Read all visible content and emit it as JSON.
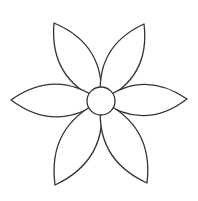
{
  "drawing": {
    "subject": "six-petal flower outline",
    "stroke_color": "#333333",
    "fill_color": "#ffffff",
    "background": "#ffffff",
    "stroke_width": 1.3,
    "center": {
      "cx": 101,
      "cy": 101,
      "r": 14
    },
    "petals": [
      {
        "name": "top-left",
        "tip": [
          54,
          23
        ]
      },
      {
        "name": "top-right",
        "tip": [
          144,
          24
        ]
      },
      {
        "name": "left",
        "tip": [
          11,
          100
        ]
      },
      {
        "name": "right",
        "tip": [
          187,
          99
        ]
      },
      {
        "name": "bottom-left",
        "tip": [
          55,
          185
        ]
      },
      {
        "name": "bottom-right",
        "tip": [
          147,
          183
        ]
      }
    ],
    "petal_bulge": 0.27
  }
}
